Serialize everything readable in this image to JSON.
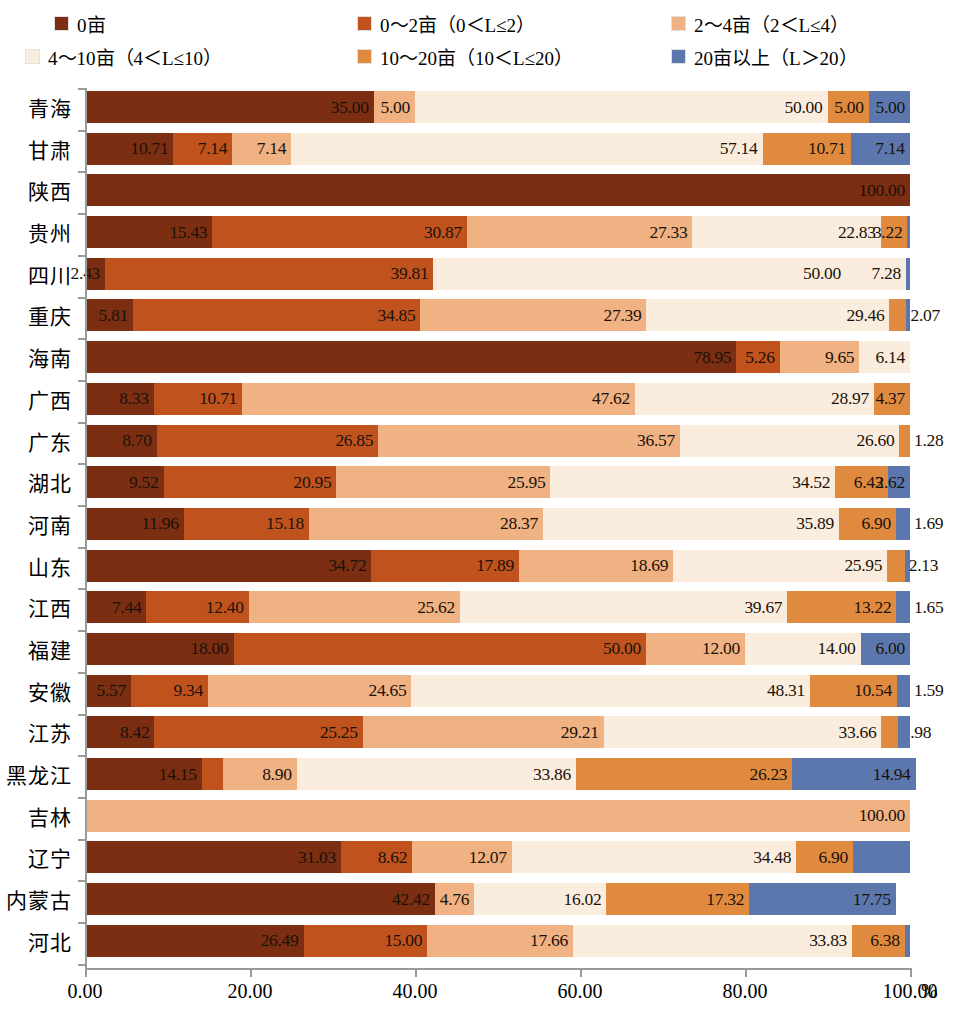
{
  "legend": {
    "items": [
      {
        "label": "0亩",
        "color": "#7B2E12",
        "key": "s0"
      },
      {
        "label": "0～2亩（0＜L≤2）",
        "color": "#C0521E",
        "key": "s1"
      },
      {
        "label": "2～4亩（2＜L≤4）",
        "color": "#F0B183",
        "key": "s2"
      },
      {
        "label": "4～10亩（4＜L≤10）",
        "color": "#FBEDDE",
        "key": "s3"
      },
      {
        "label": "10～20亩（10＜L≤20）",
        "color": "#E08A40",
        "key": "s4"
      },
      {
        "label": "20亩以上（L＞20）",
        "color": "#5B77AD",
        "key": "s5"
      }
    ]
  },
  "axis": {
    "x_ticks": [
      "0.00",
      "20.00",
      "40.00",
      "60.00",
      "80.00",
      "100.00"
    ],
    "x_unit": "%",
    "x_min": 0,
    "x_max": 100
  },
  "chart_data": {
    "type": "bar",
    "orientation": "horizontal",
    "stacked": true,
    "title": "",
    "xlabel": "%",
    "ylabel": "",
    "xlim": [
      0,
      100
    ],
    "grid": false,
    "legend_position": "top",
    "series": [
      {
        "name": "0亩",
        "color": "#7B2E12",
        "values": [
          35.0,
          10.71,
          100.0,
          15.43,
          2.43,
          5.81,
          78.95,
          8.33,
          8.7,
          9.52,
          11.96,
          34.72,
          7.44,
          18.0,
          5.57,
          8.42,
          14.15,
          0,
          31.03,
          42.42,
          26.49
        ]
      },
      {
        "name": "0～2亩（0＜L≤2）",
        "color": "#C0521E",
        "values": [
          0,
          7.14,
          0,
          30.87,
          39.81,
          34.85,
          5.26,
          10.71,
          26.85,
          20.95,
          15.18,
          17.89,
          12.4,
          50.0,
          9.34,
          25.25,
          2.6,
          0,
          8.62,
          0,
          15.0
        ]
      },
      {
        "name": "2～4亩（2＜L≤4）",
        "color": "#F0B183",
        "values": [
          5.0,
          7.14,
          0,
          27.33,
          0,
          27.39,
          9.65,
          47.62,
          36.57,
          25.95,
          28.37,
          18.69,
          25.62,
          12.0,
          24.65,
          29.21,
          8.9,
          100.0,
          12.07,
          4.76,
          17.66
        ]
      },
      {
        "name": "4～10亩（4＜L≤10）",
        "color": "#FBEDDE",
        "values": [
          50.0,
          57.14,
          0,
          22.83,
          50.0,
          29.46,
          6.14,
          28.97,
          26.6,
          34.52,
          35.89,
          25.95,
          39.67,
          14.0,
          48.31,
          33.66,
          33.86,
          0,
          34.48,
          16.02,
          33.83
        ]
      },
      {
        "name": "10～20亩（10＜L≤20）",
        "color": "#E08A40",
        "values": [
          5.0,
          10.71,
          0,
          3.22,
          7.28,
          2.07,
          0,
          4.37,
          1.28,
          6.43,
          6.9,
          2.13,
          13.22,
          0,
          10.54,
          1.98,
          26.23,
          0,
          6.9,
          17.32,
          6.38
        ]
      },
      {
        "name": "20亩以上（L＞20）",
        "color": "#5B77AD",
        "values": [
          5.0,
          7.14,
          0,
          0.32,
          0.48,
          0.42,
          0,
          0,
          0,
          2.62,
          1.69,
          0.62,
          1.65,
          6.0,
          1.59,
          1.48,
          14.94,
          0,
          6.9,
          17.75,
          0.64
        ]
      }
    ],
    "categories": [
      "青海",
      "甘肃",
      "陕西",
      "贵州",
      "四川",
      "重庆",
      "海南",
      "广西",
      "广东",
      "湖北",
      "河南",
      "山东",
      "江西",
      "福建",
      "安徽",
      "江苏",
      "黑龙江",
      "吉林",
      "辽宁",
      "内蒙古",
      "河北"
    ],
    "rows": [
      {
        "category": "青海",
        "segments": [
          {
            "key": "s0",
            "value": 35.0,
            "label": "35.00",
            "show": true
          },
          {
            "key": "s2",
            "value": 5.0,
            "label": "5.00",
            "show": true
          },
          {
            "key": "s3",
            "value": 50.0,
            "label": "50.00",
            "show": true
          },
          {
            "key": "s4",
            "value": 5.0,
            "label": "5.00",
            "show": true
          },
          {
            "key": "s5",
            "value": 5.0,
            "label": "5.00",
            "show": true
          }
        ]
      },
      {
        "category": "甘肃",
        "segments": [
          {
            "key": "s0",
            "value": 10.71,
            "label": "10.71",
            "show": true
          },
          {
            "key": "s1",
            "value": 7.14,
            "label": "7.14",
            "show": true
          },
          {
            "key": "s2",
            "value": 7.14,
            "label": "7.14",
            "show": true
          },
          {
            "key": "s3",
            "value": 57.14,
            "label": "57.14",
            "show": true
          },
          {
            "key": "s4",
            "value": 10.71,
            "label": "10.71",
            "show": true
          },
          {
            "key": "s5",
            "value": 7.14,
            "label": "7.14",
            "show": true
          }
        ]
      },
      {
        "category": "陕西",
        "segments": [
          {
            "key": "s0",
            "value": 100.0,
            "label": "100.00",
            "show": true
          }
        ]
      },
      {
        "category": "贵州",
        "segments": [
          {
            "key": "s0",
            "value": 15.43,
            "label": "15.43",
            "show": true
          },
          {
            "key": "s1",
            "value": 30.87,
            "label": "30.87",
            "show": true
          },
          {
            "key": "s2",
            "value": 27.33,
            "label": "27.33",
            "show": true
          },
          {
            "key": "s3",
            "value": 22.83,
            "label": "22.83",
            "show": true
          },
          {
            "key": "s4",
            "value": 3.22,
            "label": "3.22",
            "show": true
          },
          {
            "key": "s5",
            "value": 0.32,
            "label": "",
            "show": false
          }
        ]
      },
      {
        "category": "四川",
        "segments": [
          {
            "key": "s0",
            "value": 2.43,
            "label": "2.43",
            "show": true
          },
          {
            "key": "s1",
            "value": 39.81,
            "label": "39.81",
            "show": true
          },
          {
            "key": "s3",
            "value": 50.0,
            "label": "50.00",
            "show": true
          },
          {
            "key": "s3b",
            "value": 7.28,
            "label": "7.28",
            "show": true
          },
          {
            "key": "s5",
            "value": 0.48,
            "label": "",
            "show": false
          }
        ]
      },
      {
        "category": "重庆",
        "segments": [
          {
            "key": "s0",
            "value": 5.81,
            "label": "5.81",
            "show": true
          },
          {
            "key": "s1",
            "value": 34.85,
            "label": "34.85",
            "show": true
          },
          {
            "key": "s2",
            "value": 27.39,
            "label": "27.39",
            "show": true
          },
          {
            "key": "s3",
            "value": 29.46,
            "label": "29.46",
            "show": true
          },
          {
            "key": "s4",
            "value": 2.07,
            "label": "2.07",
            "show": true,
            "outside": true
          },
          {
            "key": "s5",
            "value": 0.42,
            "label": "",
            "show": false
          }
        ]
      },
      {
        "category": "海南",
        "segments": [
          {
            "key": "s0",
            "value": 78.95,
            "label": "78.95",
            "show": true
          },
          {
            "key": "s1",
            "value": 5.26,
            "label": "5.26",
            "show": true
          },
          {
            "key": "s2",
            "value": 9.65,
            "label": "9.65",
            "show": true
          },
          {
            "key": "s3",
            "value": 6.14,
            "label": "6.14",
            "show": true
          }
        ]
      },
      {
        "category": "广西",
        "segments": [
          {
            "key": "s0",
            "value": 8.33,
            "label": "8.33",
            "show": true
          },
          {
            "key": "s1",
            "value": 10.71,
            "label": "10.71",
            "show": true
          },
          {
            "key": "s2",
            "value": 47.62,
            "label": "47.62",
            "show": true
          },
          {
            "key": "s3",
            "value": 28.97,
            "label": "28.97",
            "show": true
          },
          {
            "key": "s4",
            "value": 4.37,
            "label": "4.37",
            "show": true
          }
        ]
      },
      {
        "category": "广东",
        "segments": [
          {
            "key": "s0",
            "value": 8.7,
            "label": "8.70",
            "show": true
          },
          {
            "key": "s1",
            "value": 26.85,
            "label": "26.85",
            "show": true
          },
          {
            "key": "s2",
            "value": 36.57,
            "label": "36.57",
            "show": true
          },
          {
            "key": "s3",
            "value": 26.6,
            "label": "26.60",
            "show": true
          },
          {
            "key": "s4",
            "value": 1.28,
            "label": "1.28",
            "show": true,
            "outside": true
          }
        ]
      },
      {
        "category": "湖北",
        "segments": [
          {
            "key": "s0",
            "value": 9.52,
            "label": "9.52",
            "show": true
          },
          {
            "key": "s1",
            "value": 20.95,
            "label": "20.95",
            "show": true
          },
          {
            "key": "s2",
            "value": 25.95,
            "label": "25.95",
            "show": true
          },
          {
            "key": "s3",
            "value": 34.52,
            "label": "34.52",
            "show": true
          },
          {
            "key": "s4",
            "value": 6.43,
            "label": "6.43",
            "show": true
          },
          {
            "key": "s5",
            "value": 2.62,
            "label": "2.62",
            "show": true
          }
        ]
      },
      {
        "category": "河南",
        "segments": [
          {
            "key": "s0",
            "value": 11.96,
            "label": "11.96",
            "show": true
          },
          {
            "key": "s1",
            "value": 15.18,
            "label": "15.18",
            "show": true
          },
          {
            "key": "s2",
            "value": 28.37,
            "label": "28.37",
            "show": true
          },
          {
            "key": "s3",
            "value": 35.89,
            "label": "35.89",
            "show": true
          },
          {
            "key": "s4",
            "value": 6.9,
            "label": "6.90",
            "show": true
          },
          {
            "key": "s5",
            "value": 1.69,
            "label": "1.69",
            "show": true,
            "outside": true
          }
        ]
      },
      {
        "category": "山东",
        "segments": [
          {
            "key": "s0",
            "value": 34.72,
            "label": "34.72",
            "show": true
          },
          {
            "key": "s1",
            "value": 17.89,
            "label": "17.89",
            "show": true
          },
          {
            "key": "s2",
            "value": 18.69,
            "label": "18.69",
            "show": true
          },
          {
            "key": "s3",
            "value": 25.95,
            "label": "25.95",
            "show": true
          },
          {
            "key": "s4",
            "value": 2.13,
            "label": "2.13",
            "show": true,
            "outside": true
          },
          {
            "key": "s5",
            "value": 0.62,
            "label": "",
            "show": false
          }
        ]
      },
      {
        "category": "江西",
        "segments": [
          {
            "key": "s0",
            "value": 7.44,
            "label": "7.44",
            "show": true
          },
          {
            "key": "s1",
            "value": 12.4,
            "label": "12.40",
            "show": true
          },
          {
            "key": "s2",
            "value": 25.62,
            "label": "25.62",
            "show": true
          },
          {
            "key": "s3",
            "value": 39.67,
            "label": "39.67",
            "show": true
          },
          {
            "key": "s4",
            "value": 13.22,
            "label": "13.22",
            "show": true
          },
          {
            "key": "s5",
            "value": 1.65,
            "label": "1.65",
            "show": true,
            "outside": true
          }
        ]
      },
      {
        "category": "福建",
        "segments": [
          {
            "key": "s0",
            "value": 18.0,
            "label": "18.00",
            "show": true
          },
          {
            "key": "s1",
            "value": 50.0,
            "label": "50.00",
            "show": true
          },
          {
            "key": "s2",
            "value": 12.0,
            "label": "12.00",
            "show": true
          },
          {
            "key": "s3",
            "value": 14.0,
            "label": "14.00",
            "show": true
          },
          {
            "key": "s5",
            "value": 6.0,
            "label": "6.00",
            "show": true
          }
        ]
      },
      {
        "category": "安徽",
        "segments": [
          {
            "key": "s0",
            "value": 5.57,
            "label": "5.57",
            "show": true
          },
          {
            "key": "s1",
            "value": 9.34,
            "label": "9.34",
            "show": true
          },
          {
            "key": "s2",
            "value": 24.65,
            "label": "24.65",
            "show": true
          },
          {
            "key": "s3",
            "value": 48.31,
            "label": "48.31",
            "show": true
          },
          {
            "key": "s4",
            "value": 10.54,
            "label": "10.54",
            "show": true
          },
          {
            "key": "s5",
            "value": 1.59,
            "label": "1.59",
            "show": true,
            "outside": true
          }
        ]
      },
      {
        "category": "江苏",
        "segments": [
          {
            "key": "s0",
            "value": 8.42,
            "label": "8.42",
            "show": true
          },
          {
            "key": "s1",
            "value": 25.25,
            "label": "25.25",
            "show": true
          },
          {
            "key": "s2",
            "value": 29.21,
            "label": "29.21",
            "show": true
          },
          {
            "key": "s3",
            "value": 33.66,
            "label": "33.66",
            "show": true
          },
          {
            "key": "s4",
            "value": 1.98,
            "label": "1.98",
            "show": true,
            "outside": true
          },
          {
            "key": "s5",
            "value": 1.48,
            "label": "",
            "show": false
          }
        ]
      },
      {
        "category": "黑龙江",
        "segments": [
          {
            "key": "s0",
            "value": 14.15,
            "label": "14.15",
            "show": true
          },
          {
            "key": "s1",
            "value": 2.6,
            "label": "",
            "show": false
          },
          {
            "key": "s2",
            "value": 8.9,
            "label": "8.90",
            "show": true
          },
          {
            "key": "s3",
            "value": 33.86,
            "label": "33.86",
            "show": true
          },
          {
            "key": "s4",
            "value": 26.23,
            "label": "26.23",
            "show": true
          },
          {
            "key": "s5",
            "value": 14.94,
            "label": "14.94",
            "show": true
          }
        ]
      },
      {
        "category": "吉林",
        "segments": [
          {
            "key": "s2",
            "value": 100.0,
            "label": "100.00",
            "show": true
          }
        ]
      },
      {
        "category": "辽宁",
        "segments": [
          {
            "key": "s0",
            "value": 31.03,
            "label": "31.03",
            "show": true
          },
          {
            "key": "s1",
            "value": 8.62,
            "label": "8.62",
            "show": true
          },
          {
            "key": "s2",
            "value": 12.07,
            "label": "12.07",
            "show": true
          },
          {
            "key": "s3",
            "value": 34.48,
            "label": "34.48",
            "show": true
          },
          {
            "key": "s4",
            "value": 6.9,
            "label": "6.90",
            "show": true
          },
          {
            "key": "s5",
            "value": 6.9,
            "label": "",
            "show": false
          }
        ]
      },
      {
        "category": "内蒙古",
        "segments": [
          {
            "key": "s0",
            "value": 42.42,
            "label": "42.42",
            "show": true
          },
          {
            "key": "s2",
            "value": 4.76,
            "label": "4.76",
            "show": true
          },
          {
            "key": "s3",
            "value": 16.02,
            "label": "16.02",
            "show": true
          },
          {
            "key": "s4",
            "value": 17.32,
            "label": "17.32",
            "show": true
          },
          {
            "key": "s5",
            "value": 17.75,
            "label": "17.75",
            "show": true
          }
        ]
      },
      {
        "category": "河北",
        "segments": [
          {
            "key": "s0",
            "value": 26.49,
            "label": "26.49",
            "show": true
          },
          {
            "key": "s1",
            "value": 15.0,
            "label": "15.00",
            "show": true
          },
          {
            "key": "s2",
            "value": 17.66,
            "label": "17.66",
            "show": true
          },
          {
            "key": "s3",
            "value": 33.83,
            "label": "33.83",
            "show": true
          },
          {
            "key": "s4",
            "value": 6.38,
            "label": "6.38",
            "show": true
          },
          {
            "key": "s5",
            "value": 0.64,
            "label": "",
            "show": false
          }
        ]
      }
    ]
  }
}
